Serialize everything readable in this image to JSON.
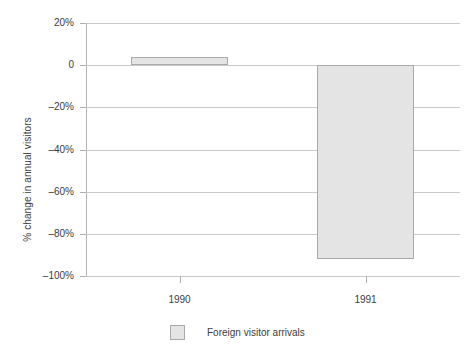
{
  "chart_data": {
    "type": "bar",
    "title": "",
    "xlabel": "",
    "ylabel": "% change in annual visitors",
    "categories": [
      "1990",
      "1991"
    ],
    "series": [
      {
        "name": "Foreign visitor arrivals",
        "values": [
          4,
          -92
        ],
        "color": "#e4e4e4",
        "border_color": "#a9a9a9"
      }
    ],
    "ylim": [
      -100,
      20
    ],
    "yticks": [
      20,
      0,
      -20,
      -40,
      -60,
      -80,
      -100
    ],
    "ytick_labels": [
      "20%",
      "0",
      "–20%",
      "–40%",
      "–60%",
      "–80%",
      "–100%"
    ],
    "grid": true,
    "legend_position": "bottom-center",
    "legend": [
      "Foreign visitor arrivals"
    ]
  },
  "axes": {
    "y_title": "% change in annual visitors"
  },
  "legend": {
    "items": [
      {
        "label": "Foreign visitor arrivals",
        "swatch_name": "legend-swatch-foreign-visitor-arrivals"
      }
    ]
  }
}
